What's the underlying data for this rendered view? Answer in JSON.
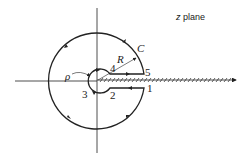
{
  "title": "z plane",
  "labels": {
    "contour": "C",
    "radius": "R",
    "small_radius": "ρ",
    "points": [
      "1",
      "2",
      "3",
      "4",
      "5"
    ]
  },
  "colors": {
    "ink": "#222222",
    "background": "#ffffff"
  }
}
